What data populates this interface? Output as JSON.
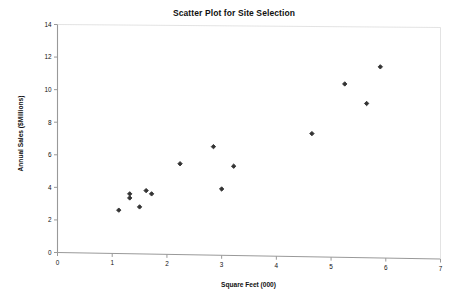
{
  "chart_data": {
    "type": "scatter",
    "title": "Scatter Plot for Site Selection",
    "xlabel": "Square Feet (000)",
    "ylabel": "Annual Sales ($Millions)",
    "xlim": [
      0,
      7
    ],
    "ylim": [
      0,
      14
    ],
    "xticks": [
      "0",
      "1",
      "2",
      "3",
      "4",
      "5",
      "6",
      "7"
    ],
    "yticks": [
      "0",
      "2",
      "4",
      "6",
      "8",
      "10",
      "12",
      "14"
    ],
    "grid": false,
    "legend": null,
    "marker": "diamond",
    "marker_color": "#333333",
    "axis_color": "#999999",
    "series": [
      {
        "name": "Sites",
        "points": [
          [
            1.12,
            2.6
          ],
          [
            1.32,
            3.6
          ],
          [
            1.32,
            3.35
          ],
          [
            1.5,
            2.8
          ],
          [
            1.62,
            3.8
          ],
          [
            1.72,
            3.6
          ],
          [
            2.24,
            5.45
          ],
          [
            2.85,
            6.5
          ],
          [
            3.0,
            3.9
          ],
          [
            3.22,
            5.3
          ],
          [
            4.65,
            7.3
          ],
          [
            5.25,
            10.35
          ],
          [
            5.65,
            9.15
          ],
          [
            5.9,
            11.4
          ]
        ]
      }
    ]
  }
}
